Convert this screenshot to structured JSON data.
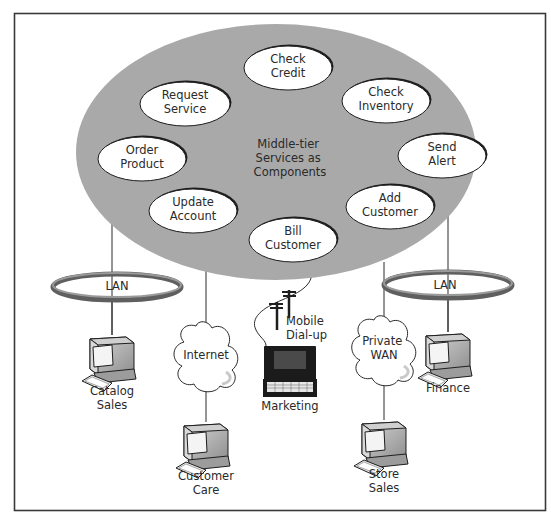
{
  "diagram": {
    "hub": {
      "label_lines": [
        "Middle-tier",
        "Services as",
        "Components"
      ]
    },
    "components": [
      {
        "id": "check-credit",
        "lines": [
          "Check",
          "Credit"
        ]
      },
      {
        "id": "request-service",
        "lines": [
          "Request",
          "Service"
        ]
      },
      {
        "id": "check-inventory",
        "lines": [
          "Check",
          "Inventory"
        ]
      },
      {
        "id": "order-product",
        "lines": [
          "Order",
          "Product"
        ]
      },
      {
        "id": "send-alert",
        "lines": [
          "Send",
          "Alert"
        ]
      },
      {
        "id": "update-account",
        "lines": [
          "Update",
          "Account"
        ]
      },
      {
        "id": "add-customer",
        "lines": [
          "Add",
          "Customer"
        ]
      },
      {
        "id": "bill-customer",
        "lines": [
          "Bill",
          "Customer"
        ]
      }
    ],
    "networks": [
      {
        "id": "lan-left",
        "type": "ring",
        "label": "LAN"
      },
      {
        "id": "internet",
        "type": "cloud",
        "lines": [
          "Internet"
        ]
      },
      {
        "id": "mobile-dialup",
        "type": "phone-line",
        "lines": [
          "Mobile",
          "Dial-up"
        ]
      },
      {
        "id": "private-wan",
        "type": "cloud",
        "lines": [
          "Private",
          "WAN"
        ]
      },
      {
        "id": "lan-right",
        "type": "ring",
        "label": "LAN"
      }
    ],
    "clients": [
      {
        "id": "catalog-sales",
        "device": "desktop",
        "lines": [
          "Catalog",
          "Sales"
        ]
      },
      {
        "id": "customer-care",
        "device": "desktop",
        "lines": [
          "Customer",
          "Care"
        ]
      },
      {
        "id": "marketing",
        "device": "laptop",
        "lines": [
          "Marketing"
        ]
      },
      {
        "id": "store-sales",
        "device": "desktop",
        "lines": [
          "Store",
          "Sales"
        ]
      },
      {
        "id": "finance",
        "device": "desktop",
        "lines": [
          "Finance"
        ]
      }
    ]
  },
  "colors": {
    "hub_fill": "#a9a9a9",
    "component_fill": "#ffffff",
    "outline": "#1e1e1e",
    "ring_dark": "#5f5f5f",
    "ring_light": "#9a9a9a",
    "text": "#2a2a2a",
    "device_body": "#bdbdbd",
    "device_dark": "#7a7a7a"
  }
}
